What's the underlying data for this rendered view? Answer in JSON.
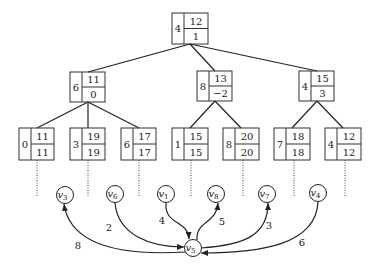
{
  "tree": {
    "root": {
      "key": "4",
      "top": "12",
      "bottom": "1"
    },
    "level1": [
      {
        "key": "6",
        "top": "11",
        "bottom": "0"
      },
      {
        "key": "8",
        "top": "13",
        "bottom": "−2"
      },
      {
        "key": "4",
        "top": "15",
        "bottom": "3"
      }
    ],
    "leaves": [
      {
        "key": "0",
        "top": "11",
        "bottom": "11"
      },
      {
        "key": "3",
        "top": "19",
        "bottom": "19"
      },
      {
        "key": "6",
        "top": "17",
        "bottom": "17"
      },
      {
        "key": "1",
        "top": "15",
        "bottom": "15"
      },
      {
        "key": "8",
        "top": "20",
        "bottom": "20"
      },
      {
        "key": "7",
        "top": "18",
        "bottom": "18"
      },
      {
        "key": "4",
        "top": "12",
        "bottom": "12"
      }
    ]
  },
  "graph": {
    "nodes": [
      {
        "id": "v3",
        "base": "v",
        "sub": "3"
      },
      {
        "id": "v6",
        "base": "v",
        "sub": "6"
      },
      {
        "id": "v1",
        "base": "v",
        "sub": "1"
      },
      {
        "id": "v8",
        "base": "v",
        "sub": "8"
      },
      {
        "id": "v7",
        "base": "v",
        "sub": "7"
      },
      {
        "id": "v4",
        "base": "v",
        "sub": "4"
      },
      {
        "id": "v5",
        "base": "v",
        "sub": "5"
      }
    ],
    "edges": [
      {
        "from": "v5",
        "to": "v3",
        "weight": "8"
      },
      {
        "from": "v6",
        "to": "v5",
        "weight": "2"
      },
      {
        "from": "v1",
        "to": "v5",
        "weight": "4"
      },
      {
        "from": "v5",
        "to": "v8",
        "weight": "5"
      },
      {
        "from": "v5",
        "to": "v7",
        "weight": "3"
      },
      {
        "from": "v4",
        "to": "v5",
        "weight": "6"
      }
    ]
  }
}
